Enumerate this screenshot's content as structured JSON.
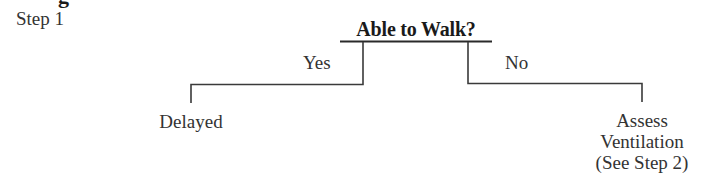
{
  "heading_fragment": "g",
  "step": {
    "label": "Step 1"
  },
  "decision": {
    "question": "Able to Walk?",
    "branches": [
      {
        "label": "Yes",
        "outcome": [
          "Delayed"
        ]
      },
      {
        "label": "No",
        "outcome": [
          "Assess",
          "Ventilation",
          "(See Step 2)"
        ]
      }
    ]
  },
  "colors": {
    "text": "#333333",
    "lines": "#3a3a3a",
    "background": "#ffffff"
  }
}
